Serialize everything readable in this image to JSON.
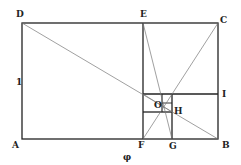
{
  "diagram": {
    "points": {
      "D": "D",
      "E": "E",
      "C": "C",
      "A": "A",
      "F": "F",
      "G": "G",
      "B": "B",
      "I": "I",
      "O": "O",
      "H": "H"
    },
    "side_labels": {
      "height": "1",
      "width_part": "φ"
    },
    "colors": {
      "thick_line": "#222222",
      "thin_line": "#777777"
    }
  }
}
